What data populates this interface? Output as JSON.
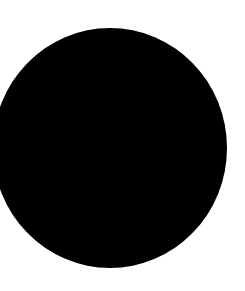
{
  "canvas": {
    "width": 245,
    "height": 291,
    "background": "#ffffff"
  },
  "shape": {
    "type": "circle",
    "fill": "#000000",
    "center_x": 110,
    "center_y": 148,
    "radius_x": 117,
    "radius_y": 120
  }
}
